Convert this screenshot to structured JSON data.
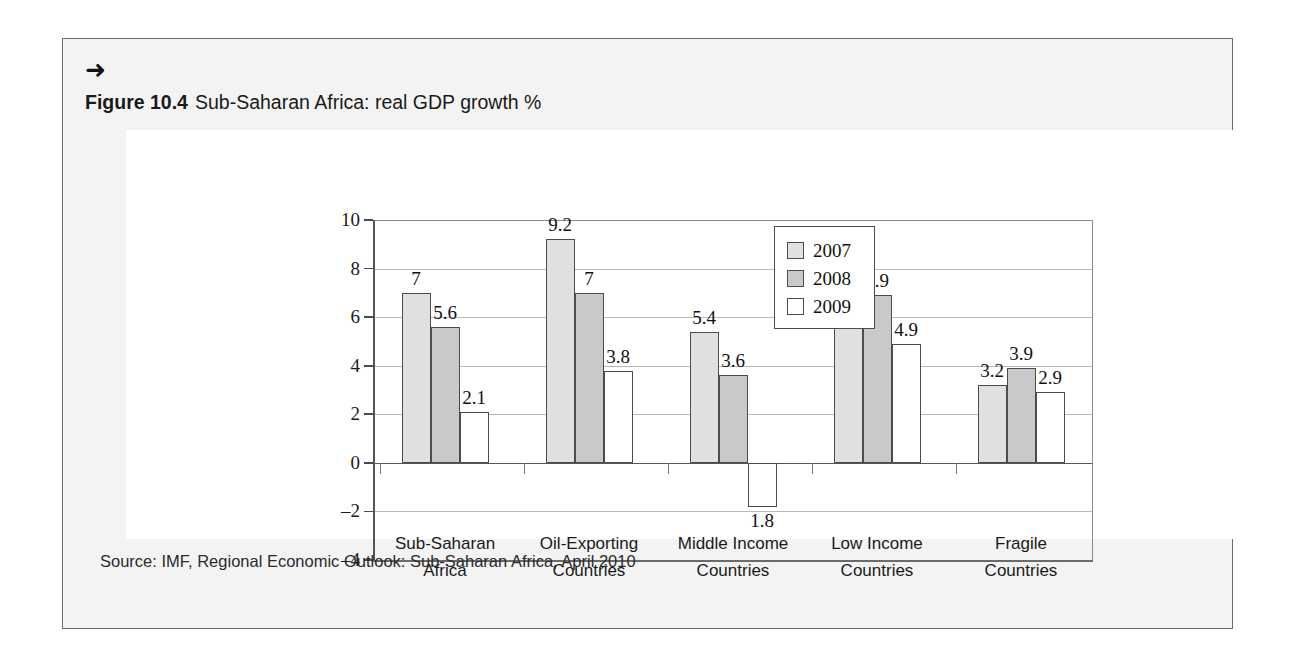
{
  "figure": {
    "arrow_glyph": "➜",
    "caption_label": "Figure 10.4",
    "caption_text": "Sub-Saharan Africa: real GDP growth %",
    "source": "Source: IMF, Regional Economic Outlook: Sub-Saharan Africa, April 2010"
  },
  "colors": {
    "frame_background": "#f3f3f3",
    "frame_border": "#6e6e6e",
    "card_background": "#ffffff",
    "series_2007": "#e0e0e0",
    "series_2008": "#c9c9c9",
    "series_2009": "#ffffff",
    "bar_outline": "#4c4c4c",
    "gridline": "#b9b9b9",
    "axis": "#555555",
    "text": "#1a1a1a"
  },
  "chart_data": {
    "type": "bar",
    "title": "Sub-Saharan Africa: real GDP growth %",
    "xlabel": "",
    "ylabel": "",
    "ylim": [
      -4,
      10
    ],
    "yticks": [
      10,
      8,
      6,
      4,
      2,
      0,
      -2,
      -4
    ],
    "ytick_labels": [
      "10",
      "8",
      "6",
      "4",
      "2",
      "0",
      "–2",
      "–4"
    ],
    "grid": true,
    "legend_position": "top-right",
    "categories": [
      "Sub-Saharan Africa",
      "Oil-Exporting Countries",
      "Middle Income Countries",
      "Low Income Countries",
      "Fragile Countries"
    ],
    "category_lines": [
      [
        "Sub-Saharan",
        "Africa"
      ],
      [
        "Oil-Exporting",
        "Countries"
      ],
      [
        "Middle Income",
        "Countries"
      ],
      [
        "Low Income",
        "Countries"
      ],
      [
        "Fragile",
        "Countries"
      ]
    ],
    "series": [
      {
        "name": "2007",
        "values": [
          7,
          9.2,
          5.4,
          7,
          3.2
        ],
        "labels": [
          "7",
          "9.2",
          "5.4",
          "7",
          "3.2"
        ]
      },
      {
        "name": "2008",
        "values": [
          5.6,
          7,
          3.6,
          6.9,
          3.9
        ],
        "labels": [
          "5.6",
          "7",
          "3.6",
          "6.9",
          "3.9"
        ]
      },
      {
        "name": "2009",
        "values": [
          2.1,
          3.8,
          -1.8,
          4.9,
          2.9
        ],
        "labels": [
          "2.1",
          "3.8",
          "1.8",
          "4.9",
          "2.9"
        ]
      }
    ]
  }
}
